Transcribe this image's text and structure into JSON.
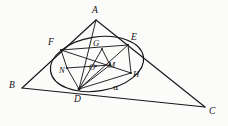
{
  "figure": {
    "kind": "euclidean-geometry-diagram",
    "background_color": "#fbfbfa",
    "ink_color": "#17161a"
  },
  "points": [
    {
      "id": "A",
      "label": "A",
      "x": 96,
      "y": 20,
      "label_x": 92,
      "label_y": 6,
      "style": "italic"
    },
    {
      "id": "B",
      "label": "B",
      "x": 22,
      "y": 88,
      "label_x": 9,
      "label_y": 81,
      "style": "italic"
    },
    {
      "id": "C",
      "label": "C",
      "x": 205,
      "y": 107,
      "label_x": 209,
      "label_y": 107,
      "style": "italic"
    },
    {
      "id": "D",
      "label": "D",
      "x": 79,
      "y": 89,
      "label_x": 74,
      "label_y": 95,
      "style": "italic"
    },
    {
      "id": "E",
      "label": "E",
      "x": 128,
      "y": 45,
      "label_x": 131,
      "label_y": 33,
      "style": "italic"
    },
    {
      "id": "F",
      "label": "F",
      "x": 61,
      "y": 50,
      "label_x": 48,
      "label_y": 38,
      "style": "italic"
    },
    {
      "id": "G",
      "label": "G",
      "x": 102,
      "y": 49,
      "label_x": 93,
      "label_y": 39,
      "style": "italic"
    },
    {
      "id": "H",
      "label": "H",
      "x": 131,
      "y": 73,
      "label_x": 133,
      "label_y": 70,
      "style": "italic"
    },
    {
      "id": "M",
      "label": "M",
      "x": 110,
      "y": 65,
      "label_x": 108,
      "label_y": 61,
      "style": "italic"
    },
    {
      "id": "N",
      "label": "N",
      "x": 67,
      "y": 68,
      "label_x": 59,
      "label_y": 66,
      "style": "italic"
    },
    {
      "id": "O",
      "label": "O",
      "x": 96,
      "y": 66,
      "label_x": 89,
      "label_y": 63,
      "style": "italic"
    },
    {
      "id": "alpha",
      "label": "α",
      "x": 116,
      "y": 86,
      "label_x": 113,
      "label_y": 83,
      "style": "greek"
    }
  ],
  "segments": [
    {
      "name": "side-AB",
      "from": "A",
      "to": "B",
      "weight": "main"
    },
    {
      "name": "side-AC",
      "from": "A",
      "to": "C",
      "weight": "main"
    },
    {
      "name": "side-BC",
      "from": "B",
      "to": "C",
      "weight": "main"
    },
    {
      "name": "cevian-A-D",
      "from": "A",
      "to": "D",
      "weight": "inner"
    },
    {
      "name": "chord-F-N",
      "from": "F",
      "to": "N",
      "weight": "inner"
    },
    {
      "name": "chord-N-D",
      "from": "N",
      "to": "D",
      "weight": "inner"
    },
    {
      "name": "chord-F-E",
      "from": "F",
      "to": "E",
      "weight": "inner"
    },
    {
      "name": "chord-E-H",
      "from": "E",
      "to": "H",
      "weight": "inner"
    },
    {
      "name": "chord-D-H",
      "from": "D",
      "to": "H",
      "weight": "inner"
    },
    {
      "name": "chord-D-E",
      "from": "D",
      "to": "E",
      "weight": "inner"
    },
    {
      "name": "chord-D-G",
      "from": "D",
      "to": "G",
      "weight": "inner"
    },
    {
      "name": "chord-D-M",
      "from": "D",
      "to": "M",
      "weight": "inner"
    },
    {
      "name": "chord-N-M",
      "from": "N",
      "to": "M",
      "weight": "inner"
    },
    {
      "name": "chord-G-M",
      "from": "G",
      "to": "M",
      "weight": "inner"
    },
    {
      "name": "chord-F-H",
      "from": "F",
      "to": "H",
      "weight": "inner"
    }
  ],
  "conic": {
    "name": "inscribed-ellipse",
    "center_x": 97,
    "center_y": 64,
    "radius_x": 47,
    "radius_y": 27,
    "rotation_deg": -9
  }
}
